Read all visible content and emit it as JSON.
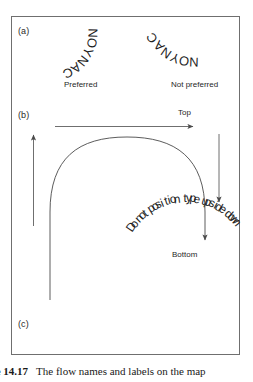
{
  "figure": {
    "caption_number": "re 14.17",
    "caption_text": "The flow names and labels on the map",
    "panels": {
      "a": "(a)",
      "b": "(b)",
      "c": "(c)"
    }
  },
  "panel_a": {
    "curved_label_left": "CANYON",
    "curved_label_right": "CANYON",
    "caption_left": "Preferred",
    "caption_right": "Not preferred"
  },
  "panel_b": {
    "top_label": "Top",
    "bottom_label": "Bottom",
    "arrows": [
      {
        "name": "top-horizontal-arrow",
        "direction": "right"
      },
      {
        "name": "left-vertical-arrow",
        "direction": "up"
      },
      {
        "name": "right-vertical-arrow",
        "direction": "down"
      },
      {
        "name": "arch-flow-arrow",
        "direction": "clockwise"
      }
    ]
  },
  "panel_c": {
    "curved_label": "Do not position type upside down"
  },
  "colors": {
    "frame": "#6f6f6f",
    "ink": "#1f1f1f",
    "stroke": "#4a4a4a"
  }
}
